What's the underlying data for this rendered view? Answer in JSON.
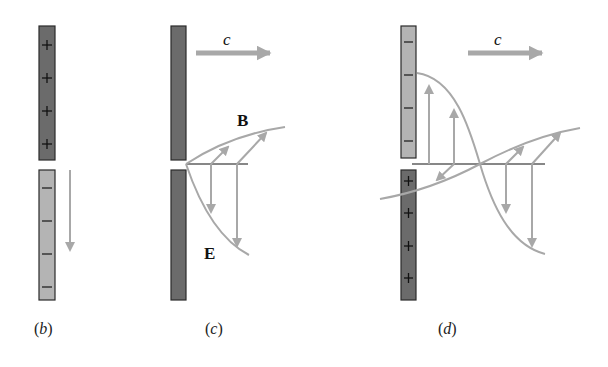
{
  "colors": {
    "plate_positive": "#6b6b6b",
    "plate_negative": "#b4b4b4",
    "plate_border": "#2a2a2a",
    "wave": "#a8a8a8",
    "arrow": "#a8a8a8",
    "axis": "#111111",
    "text": "#111111"
  },
  "panels": [
    {
      "id": "b",
      "caption_open": "(",
      "caption_letter": "b",
      "caption_close": ")",
      "top_plate_signs": [
        "+",
        "+",
        "+",
        "+"
      ],
      "bottom_plate_signs": [
        "−",
        "−",
        "−",
        "−"
      ]
    },
    {
      "id": "c",
      "caption_open": "(",
      "caption_letter": "c",
      "caption_close": ")",
      "velocity_label": "c",
      "b_field_label": "B",
      "e_field_label": "E"
    },
    {
      "id": "d",
      "caption_open": "(",
      "caption_letter": "d",
      "caption_close": ")",
      "velocity_label": "c",
      "top_plate_signs": [
        "−",
        "−",
        "−",
        "−"
      ],
      "bottom_plate_signs": [
        "+",
        "+",
        "+",
        "+"
      ]
    }
  ]
}
